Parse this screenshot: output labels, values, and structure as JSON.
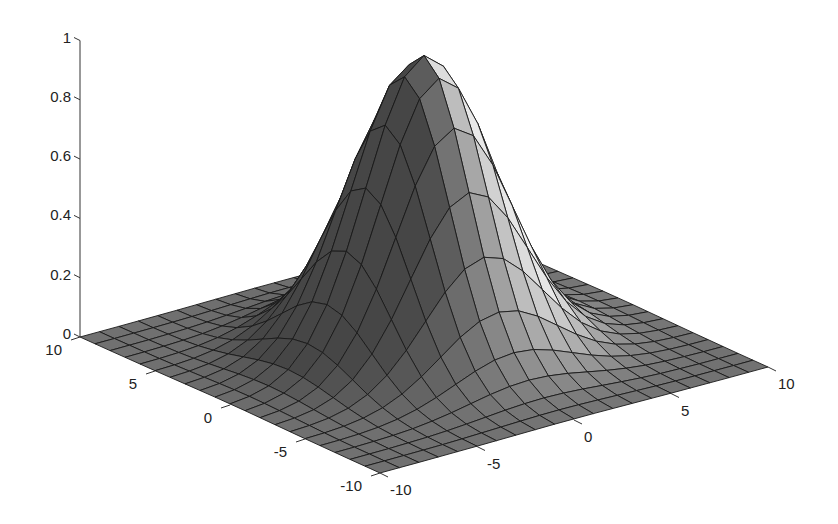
{
  "chart_data": {
    "type": "surface",
    "title": "",
    "xlabel": "",
    "ylabel": "",
    "zlabel": "",
    "function": "z = exp(-(x^2 + y^2) / 18)",
    "x": {
      "min": -10,
      "max": 10,
      "step": 1
    },
    "y": {
      "min": -10,
      "max": 10,
      "step": 1
    },
    "zlim": [
      0,
      1
    ],
    "peak": {
      "x": 0,
      "y": 0,
      "z": 1
    },
    "colormap": "gray",
    "shading": "faceted-lit",
    "grid": false,
    "x_ticks": [
      -10,
      -5,
      0,
      5,
      10
    ],
    "y_ticks": [
      -10,
      -5,
      0,
      5,
      10
    ],
    "z_ticks": [
      0,
      0.2,
      0.4,
      0.6,
      0.8,
      1
    ],
    "x_tick_labels": [
      "-10",
      "-5",
      "0",
      "5",
      "10"
    ],
    "y_tick_labels": [
      "-10",
      "-5",
      "0",
      "5",
      "10"
    ],
    "z_tick_labels": [
      "0",
      "0.2",
      "0.4",
      "0.6",
      "0.8",
      "1"
    ]
  },
  "colors": {
    "background": "#ffffff",
    "mesh_edge": "#1a1a1a",
    "axis": "#333333",
    "text": "#222222"
  }
}
